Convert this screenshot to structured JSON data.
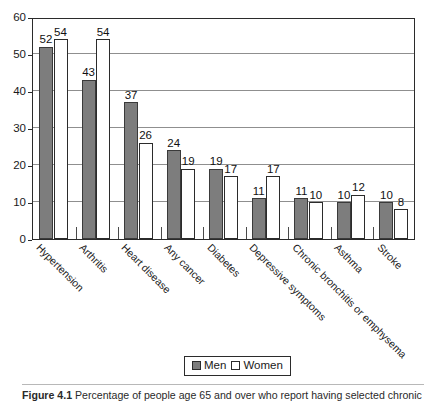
{
  "figure": {
    "caption_label": "Figure 4.1",
    "caption_text": "Percentage of people age 65 and over who report having selected chronic"
  },
  "legend": {
    "men_label": "Men",
    "women_label": "Women",
    "men_color": "#7d7d7d",
    "women_color": "#ffffff"
  },
  "chart_data": {
    "type": "bar",
    "title": "",
    "subtitle": "",
    "xlabel": "",
    "ylabel": "",
    "ylim": [
      0,
      60
    ],
    "yticks": [
      0,
      10,
      20,
      30,
      40,
      50,
      60
    ],
    "ytick_labels": [
      "0",
      "10",
      "20",
      "30",
      "40",
      "50",
      "60"
    ],
    "grid": true,
    "grid_axis": "y",
    "legend_position": "bottom-center",
    "categories": [
      "Hypertension",
      "Arthritis",
      "Heart disease",
      "Any cancer",
      "Diabetes",
      "Depressive symptoms",
      "Chronic bronchitis or emphysema",
      "Asthma",
      "Stroke"
    ],
    "series": [
      {
        "name": "Men",
        "color": "#7d7d7d",
        "values": [
          52,
          43,
          37,
          24,
          19,
          11,
          11,
          10,
          10
        ]
      },
      {
        "name": "Women",
        "color": "#ffffff",
        "values": [
          54,
          54,
          26,
          19,
          17,
          17,
          10,
          12,
          8
        ]
      }
    ],
    "data_labels": [
      [
        "52",
        "54"
      ],
      [
        "43",
        "54"
      ],
      [
        "37",
        "26"
      ],
      [
        "24",
        "19"
      ],
      [
        "19",
        "17"
      ],
      [
        "11",
        "17"
      ],
      [
        "11",
        "10"
      ],
      [
        "10",
        "12"
      ],
      [
        "10",
        "8"
      ]
    ]
  }
}
